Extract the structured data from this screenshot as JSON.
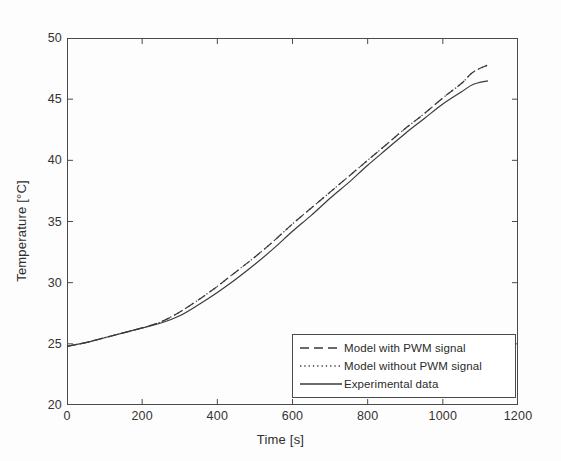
{
  "chart_data": {
    "type": "line",
    "title": "",
    "xlabel": "Time [s]",
    "ylabel": "Temperature [°C]",
    "xlim": [
      0,
      1200
    ],
    "ylim": [
      20,
      50
    ],
    "xticks": [
      0,
      200,
      400,
      600,
      800,
      1000,
      1200
    ],
    "xtick_labels": [
      "0",
      "200",
      "400",
      "600",
      "800",
      "1000",
      "1200"
    ],
    "yticks": [
      20,
      25,
      30,
      35,
      40,
      45,
      50
    ],
    "ytick_labels": [
      "20",
      "25",
      "30",
      "35",
      "40",
      "45",
      "50"
    ],
    "grid": false,
    "legend_position": "lower right",
    "line_color": "#3a3a3a",
    "frame_color": "#4a4a4a",
    "background": "#fdfdfd",
    "x": [
      0,
      50,
      100,
      150,
      200,
      250,
      300,
      350,
      400,
      450,
      500,
      550,
      600,
      650,
      700,
      750,
      800,
      850,
      900,
      950,
      1000,
      1050,
      1080,
      1120
    ],
    "series": [
      {
        "name": "Model with PWM signal",
        "style": "dashed",
        "values": [
          24.8,
          25.1,
          25.5,
          25.9,
          26.3,
          26.8,
          27.6,
          28.6,
          29.7,
          30.9,
          32.1,
          33.4,
          34.8,
          36.1,
          37.4,
          38.7,
          40.0,
          41.3,
          42.6,
          43.8,
          45.1,
          46.3,
          47.2,
          47.8
        ]
      },
      {
        "name": "Model without PWM signal",
        "style": "dotted",
        "values": [
          24.8,
          25.1,
          25.5,
          25.9,
          26.3,
          26.8,
          27.6,
          28.6,
          29.7,
          30.9,
          32.1,
          33.4,
          34.8,
          36.1,
          37.4,
          38.7,
          40.0,
          41.3,
          42.6,
          43.8,
          45.1,
          46.3,
          47.2,
          47.8
        ]
      },
      {
        "name": "Experimental data",
        "style": "solid",
        "values": [
          24.8,
          25.1,
          25.5,
          25.9,
          26.3,
          26.7,
          27.3,
          28.2,
          29.2,
          30.3,
          31.5,
          32.8,
          34.2,
          35.5,
          36.9,
          38.2,
          39.6,
          40.9,
          42.2,
          43.4,
          44.6,
          45.6,
          46.2,
          46.5
        ]
      }
    ]
  },
  "legend": {
    "entries": [
      {
        "label": "Model with PWM signal",
        "style": "dashed"
      },
      {
        "label": "Model without PWM signal",
        "style": "dotted"
      },
      {
        "label": "Experimental data",
        "style": "solid"
      }
    ]
  },
  "axes": {
    "x_title": "Time [s]",
    "y_title": "Temperature [°C]"
  }
}
